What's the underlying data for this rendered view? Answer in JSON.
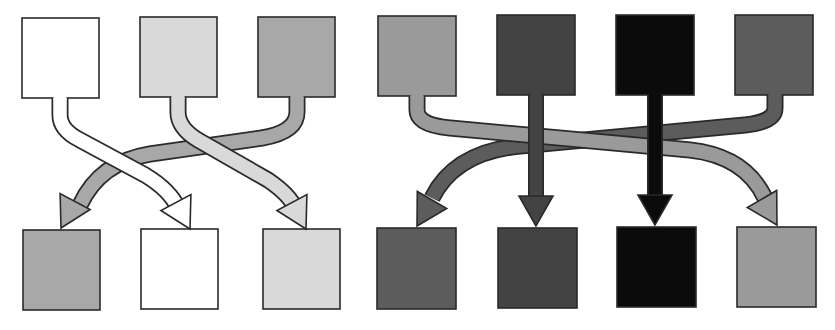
{
  "colors": {
    "white": "#ffffff",
    "light_gray": "#d9d9d9",
    "mid_gray": "#a8a8a8",
    "gray": "#9a9a9a",
    "dark_gray": "#5c5c5c",
    "darker_gray": "#434343",
    "black": "#0b0b0b",
    "stroke": "#2a2a2a"
  },
  "panels": [
    {
      "name": "left-panel",
      "description": "3-element permutation",
      "top_boxes": [
        {
          "x": 22,
          "y": 18,
          "w": 77,
          "h": 80,
          "color": "#ffffff"
        },
        {
          "x": 140,
          "y": 17,
          "w": 77,
          "h": 80,
          "color": "#d9d9d9"
        },
        {
          "x": 258,
          "y": 17,
          "w": 77,
          "h": 80,
          "color": "#a8a8a8"
        }
      ],
      "bottom_boxes": [
        {
          "x": 23,
          "y": 230,
          "w": 77,
          "h": 80,
          "color": "#a8a8a8"
        },
        {
          "x": 141,
          "y": 229,
          "w": 77,
          "h": 80,
          "color": "#ffffff"
        },
        {
          "x": 263,
          "y": 229,
          "w": 77,
          "h": 80,
          "color": "#d9d9d9"
        }
      ],
      "arrows": [
        {
          "from": 2,
          "to": 0,
          "color": "#a8a8a8",
          "width": 14,
          "path": "M 297 97 L 297 112 Q 297 132 262 138 L 150 154 Q 100 162 80 205",
          "head": {
            "tip": [
              61,
              228
            ],
            "angle": 118
          }
        },
        {
          "from": 0,
          "to": 1,
          "color": "#ffffff",
          "width": 14,
          "path": "M 60 98 L 60 115 Q 60 130 80 140 L 145 175 Q 170 190 178 208",
          "head": {
            "tip": [
              190,
              229
            ],
            "angle": 62
          }
        },
        {
          "from": 1,
          "to": 2,
          "color": "#d9d9d9",
          "width": 14,
          "path": "M 178 97 L 178 112 Q 178 128 198 140 L 268 180 Q 290 195 295 208",
          "head": {
            "tip": [
              306,
              229
            ],
            "angle": 62
          }
        }
      ]
    },
    {
      "name": "right-panel",
      "description": "4-element permutation",
      "top_boxes": [
        {
          "x": 378,
          "y": 16,
          "w": 78,
          "h": 80,
          "color": "#9a9a9a"
        },
        {
          "x": 497,
          "y": 15,
          "w": 78,
          "h": 80,
          "color": "#434343"
        },
        {
          "x": 616,
          "y": 15,
          "w": 78,
          "h": 80,
          "color": "#0b0b0b"
        },
        {
          "x": 735,
          "y": 15,
          "w": 78,
          "h": 80,
          "color": "#5c5c5c"
        }
      ],
      "bottom_boxes": [
        {
          "x": 377,
          "y": 228,
          "w": 79,
          "h": 81,
          "color": "#5c5c5c"
        },
        {
          "x": 498,
          "y": 228,
          "w": 79,
          "h": 80,
          "color": "#434343"
        },
        {
          "x": 617,
          "y": 227,
          "w": 79,
          "h": 80,
          "color": "#0b0b0b"
        },
        {
          "x": 737,
          "y": 227,
          "w": 79,
          "h": 80,
          "color": "#9a9a9a"
        }
      ],
      "arrows": [
        {
          "from": 3,
          "to": 0,
          "color": "#5c5c5c",
          "width": 14,
          "path": "M 775 95 L 775 108 Q 775 122 745 125 L 520 146 Q 455 152 432 198",
          "head": {
            "tip": [
              417,
              226
            ],
            "angle": 120
          }
        },
        {
          "from": 0,
          "to": 3,
          "color": "#9a9a9a",
          "width": 14,
          "path": "M 417 96 L 417 110 Q 417 125 450 128 L 690 150 Q 745 156 765 198",
          "head": {
            "tip": [
              777,
              225
            ],
            "angle": 60
          }
        },
        {
          "from": 1,
          "to": 1,
          "color": "#434343",
          "width": 13,
          "path": "M 536 95 L 536 196",
          "head": {
            "tip": [
              536,
              226
            ],
            "angle": 90
          }
        },
        {
          "from": 2,
          "to": 2,
          "color": "#0b0b0b",
          "width": 13,
          "path": "M 655 95 L 655 196",
          "head": {
            "tip": [
              655,
              225
            ],
            "angle": 90
          }
        }
      ]
    }
  ]
}
